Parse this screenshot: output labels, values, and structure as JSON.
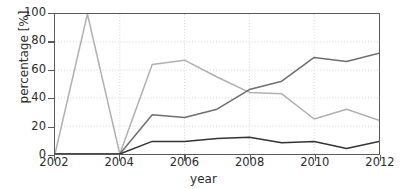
{
  "chart_data": {
    "type": "line",
    "title": "",
    "xlabel": "year",
    "ylabel": "percentage [%]",
    "xlim": [
      2002,
      2012
    ],
    "ylim": [
      0,
      100
    ],
    "grid": true,
    "legend": "none",
    "x": [
      2002,
      2003,
      2004,
      2005,
      2006,
      2007,
      2008,
      2009,
      2010,
      2011,
      2012
    ],
    "xticks": [
      "2002",
      "2004",
      "2006",
      "2008",
      "2010",
      "2012"
    ],
    "xtick_values": [
      2002,
      2004,
      2006,
      2008,
      2010,
      2012
    ],
    "yticks": [
      "0",
      "20",
      "40",
      "60",
      "80",
      "100"
    ],
    "ytick_values": [
      0,
      20,
      40,
      60,
      80,
      100
    ],
    "series": [
      {
        "name": "series-light",
        "color": "#b0b0b0",
        "values": [
          0,
          100,
          0,
          64,
          67,
          55,
          44,
          43,
          25,
          32,
          24
        ]
      },
      {
        "name": "series-medium",
        "color": "#6e6e6e",
        "values": [
          0,
          0,
          0,
          28,
          26,
          32,
          46,
          52,
          69,
          66,
          72
        ]
      },
      {
        "name": "series-dark",
        "color": "#333333",
        "values": [
          0,
          0,
          0,
          9,
          9,
          11,
          12,
          8,
          9,
          4,
          9
        ]
      }
    ]
  }
}
